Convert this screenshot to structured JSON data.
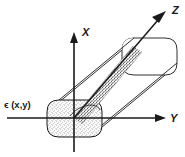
{
  "figure": {
    "kind": "waveguide-coordinate-diagram",
    "background_color": "#ffffff",
    "line_color": "#1a1a1a",
    "stipple_color": "#6b6b6b",
    "axes": [
      {
        "id": "x",
        "label": "X",
        "direction": "up",
        "label_x": 82,
        "label_y": 32
      },
      {
        "id": "y",
        "label": "Y",
        "direction": "right",
        "label_x": 170,
        "label_y": 122
      },
      {
        "id": "z",
        "label": "Z",
        "direction": "up-right-diagonal",
        "label_x": 172,
        "label_y": 14
      }
    ],
    "annotations": [
      {
        "id": "permittivity",
        "text": "ϵ (x,y)",
        "x": 4,
        "y": 108,
        "meaning": "permittivity-profile-label"
      }
    ],
    "origin": {
      "x": 74,
      "y": 118
    },
    "rod": {
      "cross_section_shape": "rounded-rectangle",
      "texture": "stipple",
      "near_face": {
        "left": 47,
        "top": 100,
        "right": 102,
        "bottom": 137
      },
      "far_face": {
        "left": 122,
        "top": 38,
        "right": 177,
        "bottom": 75
      }
    }
  }
}
